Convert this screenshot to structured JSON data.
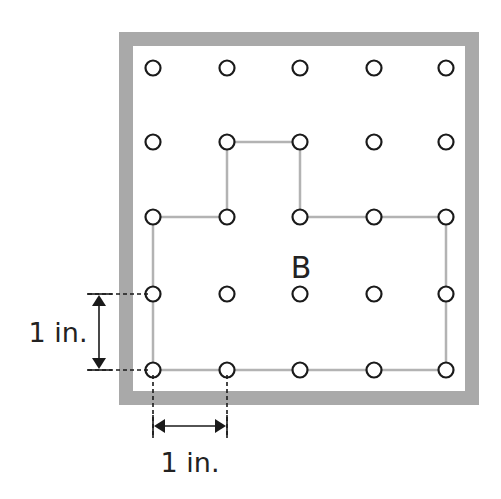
{
  "figure": {
    "shape_label": "B",
    "vertical_dimension_label": "1 in.",
    "horizontal_dimension_label": "1 in.",
    "colors": {
      "frame": "#a9a9a9",
      "shape_line": "#b3b3b3",
      "peg_stroke": "#1a1a1a",
      "dimension": "#1a1a1a",
      "background": "#ffffff"
    },
    "geoboard": {
      "rows": 5,
      "cols": 5,
      "col_x": [
        153,
        227,
        300,
        374,
        446
      ],
      "row_y": [
        68,
        142,
        217,
        294,
        370
      ]
    },
    "shape_vertices_grid": [
      [
        0,
        2
      ],
      [
        1,
        2
      ],
      [
        1,
        1
      ],
      [
        2,
        1
      ],
      [
        2,
        2
      ],
      [
        3,
        2
      ],
      [
        4,
        2
      ],
      [
        4,
        3
      ],
      [
        4,
        4
      ],
      [
        3,
        4
      ],
      [
        2,
        4
      ],
      [
        1,
        4
      ],
      [
        0,
        4
      ],
      [
        0,
        3
      ]
    ]
  }
}
